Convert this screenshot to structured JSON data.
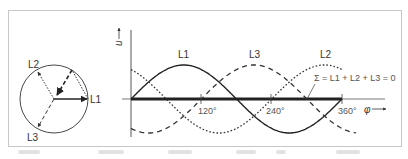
{
  "phasor_diagram": {
    "labels": {
      "l1": "L1",
      "l2": "L2",
      "l3": "L3"
    }
  },
  "waveform_chart": {
    "y_axis_label": "u",
    "x_axis_label": "φ",
    "ticks": [
      "120°",
      "240°",
      "360°"
    ],
    "curve_labels": {
      "l1": "L1",
      "l2": "L2",
      "l3": "L3"
    },
    "sum_equation": "Σ = L1 + L2 + L3 = 0"
  },
  "chart_data": {
    "type": "line",
    "xlabel": "φ",
    "ylabel": "u",
    "x": [
      0,
      30,
      60,
      90,
      120,
      150,
      180,
      210,
      240,
      270,
      300,
      330,
      360
    ],
    "xlim": [
      0,
      360
    ],
    "ylim": [
      -1,
      1
    ],
    "x_ticks": [
      "120°",
      "240°",
      "360°"
    ],
    "grid": false,
    "series": [
      {
        "name": "L1",
        "style": "solid",
        "values": [
          0,
          0.5,
          0.866,
          1,
          0.866,
          0.5,
          0,
          -0.5,
          -0.866,
          -1,
          -0.866,
          -0.5,
          0
        ]
      },
      {
        "name": "L2",
        "style": "dotted",
        "values": [
          0.866,
          0.5,
          0,
          -0.5,
          -0.866,
          -1,
          -0.866,
          -0.5,
          0,
          0.5,
          0.866,
          1,
          0.866
        ]
      },
      {
        "name": "L3",
        "style": "dashed",
        "values": [
          -0.866,
          -1,
          -0.866,
          -0.5,
          0,
          0.5,
          0.866,
          1,
          0.866,
          0.5,
          0,
          -0.5,
          -0.866
        ]
      },
      {
        "name": "Σ = L1 + L2 + L3 = 0",
        "style": "bold",
        "values": [
          0,
          0,
          0,
          0,
          0,
          0,
          0,
          0,
          0,
          0,
          0,
          0,
          0
        ]
      }
    ],
    "annotations": [
      "Σ = L1 + L2 + L3 = 0"
    ]
  }
}
